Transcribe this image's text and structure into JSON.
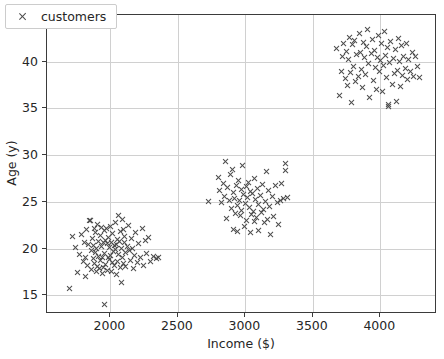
{
  "chart_data": {
    "type": "scatter",
    "title": "",
    "xlabel": "Income ($)",
    "ylabel": "Age (y)",
    "xlim": [
      1530,
      4420
    ],
    "ylim": [
      13.0,
      45.0
    ],
    "xticks": [
      2000,
      2500,
      3000,
      3500,
      4000
    ],
    "xticklabels": [
      "2000",
      "2500",
      "3000",
      "3500",
      "4000"
    ],
    "yticks": [
      15,
      20,
      25,
      30,
      35,
      40,
      45
    ],
    "yticklabels": [
      "15",
      "20",
      "25",
      "30",
      "35",
      "40",
      "45"
    ],
    "grid": true,
    "legend": {
      "position": "upper left",
      "entries": [
        {
          "label": "customers",
          "marker": "x",
          "color": "#4b4b4b"
        }
      ]
    },
    "series": [
      {
        "name": "customers",
        "marker": "x",
        "color": "#4b4b4b",
        "clusters": [
          {
            "name": "low-income",
            "center_x": 2010,
            "center_y": 19.6,
            "n": 120
          },
          {
            "name": "mid-income",
            "center_x": 3010,
            "center_y": 25.1,
            "n": 120
          },
          {
            "name": "high-income",
            "center_x": 4000,
            "center_y": 40.0,
            "n": 120
          }
        ],
        "points": [
          [
            1700,
            15.7
          ],
          [
            1958,
            14.0
          ],
          [
            1718,
            21.3
          ],
          [
            1745,
            20.1
          ],
          [
            1760,
            17.4
          ],
          [
            1772,
            19.4
          ],
          [
            1788,
            21.5
          ],
          [
            1800,
            18.6
          ],
          [
            1808,
            20.7
          ],
          [
            1815,
            17.0
          ],
          [
            1820,
            19.0
          ],
          [
            1826,
            22.0
          ],
          [
            1833,
            18.2
          ],
          [
            1840,
            20.4
          ],
          [
            1846,
            23.0
          ],
          [
            1852,
            23.0
          ],
          [
            1858,
            19.8
          ],
          [
            1862,
            17.8
          ],
          [
            1868,
            21.1
          ],
          [
            1872,
            18.9
          ],
          [
            1876,
            20.3
          ],
          [
            1880,
            22.2
          ],
          [
            1884,
            18.4
          ],
          [
            1888,
            19.6
          ],
          [
            1892,
            21.7
          ],
          [
            1896,
            17.6
          ],
          [
            1900,
            20.0
          ],
          [
            1904,
            18.1
          ],
          [
            1908,
            22.6
          ],
          [
            1912,
            19.2
          ],
          [
            1916,
            20.8
          ],
          [
            1920,
            17.9
          ],
          [
            1924,
            21.4
          ],
          [
            1928,
            18.7
          ],
          [
            1932,
            20.2
          ],
          [
            1936,
            22.3
          ],
          [
            1940,
            19.1
          ],
          [
            1944,
            17.3
          ],
          [
            1948,
            20.6
          ],
          [
            1952,
            18.0
          ],
          [
            1956,
            21.9
          ],
          [
            1960,
            19.5
          ],
          [
            1964,
            20.9
          ],
          [
            1968,
            18.3
          ],
          [
            1972,
            22.1
          ],
          [
            1976,
            17.7
          ],
          [
            1980,
            20.5
          ],
          [
            1984,
            19.0
          ],
          [
            1988,
            21.2
          ],
          [
            1992,
            18.8
          ],
          [
            1996,
            20.1
          ],
          [
            2000,
            22.4
          ],
          [
            2004,
            19.3
          ],
          [
            2008,
            17.5
          ],
          [
            2012,
            20.7
          ],
          [
            2016,
            18.5
          ],
          [
            2020,
            21.6
          ],
          [
            2024,
            19.7
          ],
          [
            2028,
            20.3
          ],
          [
            2032,
            18.2
          ],
          [
            2036,
            22.8
          ],
          [
            2040,
            19.9
          ],
          [
            2044,
            17.2
          ],
          [
            2048,
            20.4
          ],
          [
            2052,
            21.0
          ],
          [
            2056,
            18.6
          ],
          [
            2060,
            23.5
          ],
          [
            2064,
            19.4
          ],
          [
            2068,
            20.8
          ],
          [
            2072,
            18.0
          ],
          [
            2076,
            21.8
          ],
          [
            2080,
            16.4
          ],
          [
            2084,
            20.0
          ],
          [
            2088,
            23.1
          ],
          [
            2092,
            19.1
          ],
          [
            2096,
            22.0
          ],
          [
            2100,
            18.4
          ],
          [
            2104,
            20.6
          ],
          [
            2108,
            21.3
          ],
          [
            2112,
            19.6
          ],
          [
            2116,
            18.1
          ],
          [
            2124,
            20.2
          ],
          [
            2132,
            22.5
          ],
          [
            2140,
            19.8
          ],
          [
            2148,
            18.7
          ],
          [
            2156,
            21.1
          ],
          [
            2164,
            20.0
          ],
          [
            2172,
            17.9
          ],
          [
            2180,
            19.3
          ],
          [
            2190,
            21.7
          ],
          [
            2200,
            18.5
          ],
          [
            2212,
            20.5
          ],
          [
            2224,
            19.0
          ],
          [
            2236,
            22.1
          ],
          [
            2248,
            18.2
          ],
          [
            2260,
            20.9
          ],
          [
            2272,
            19.5
          ],
          [
            2286,
            21.2
          ],
          [
            2300,
            18.6
          ],
          [
            2320,
            19.2
          ],
          [
            2340,
            18.9
          ],
          [
            2360,
            19.0
          ],
          [
            2730,
            25.0
          ],
          [
            2800,
            27.6
          ],
          [
            2812,
            26.2
          ],
          [
            2824,
            24.9
          ],
          [
            2836,
            27.0
          ],
          [
            2848,
            25.6
          ],
          [
            2856,
            29.3
          ],
          [
            2864,
            23.2
          ],
          [
            2872,
            26.5
          ],
          [
            2880,
            25.1
          ],
          [
            2888,
            27.9
          ],
          [
            2896,
            24.3
          ],
          [
            2904,
            28.5
          ],
          [
            2910,
            26.0
          ],
          [
            2916,
            22.0
          ],
          [
            2922,
            25.4
          ],
          [
            2928,
            23.8
          ],
          [
            2934,
            26.8
          ],
          [
            2940,
            24.6
          ],
          [
            2946,
            21.8
          ],
          [
            2952,
            27.3
          ],
          [
            2958,
            25.2
          ],
          [
            2964,
            23.5
          ],
          [
            2970,
            26.3
          ],
          [
            2976,
            24.1
          ],
          [
            2982,
            28.9
          ],
          [
            2988,
            25.8
          ],
          [
            2994,
            22.4
          ],
          [
            3000,
            24.8
          ],
          [
            3006,
            26.6
          ],
          [
            3012,
            23.0
          ],
          [
            3018,
            25.5
          ],
          [
            3024,
            27.1
          ],
          [
            3030,
            24.4
          ],
          [
            3036,
            21.7
          ],
          [
            3042,
            26.1
          ],
          [
            3048,
            23.6
          ],
          [
            3054,
            25.9
          ],
          [
            3060,
            24.0
          ],
          [
            3066,
            27.5
          ],
          [
            3072,
            22.9
          ],
          [
            3078,
            25.3
          ],
          [
            3084,
            23.3
          ],
          [
            3090,
            26.4
          ],
          [
            3096,
            24.7
          ],
          [
            3102,
            21.9
          ],
          [
            3110,
            25.7
          ],
          [
            3118,
            23.9
          ],
          [
            3126,
            26.9
          ],
          [
            3134,
            24.2
          ],
          [
            3142,
            22.8
          ],
          [
            3150,
            25.0
          ],
          [
            3158,
            28.3
          ],
          [
            3166,
            23.1
          ],
          [
            3174,
            26.2
          ],
          [
            3182,
            24.5
          ],
          [
            3190,
            21.5
          ],
          [
            3200,
            25.6
          ],
          [
            3212,
            23.4
          ],
          [
            3224,
            26.7
          ],
          [
            3236,
            24.9
          ],
          [
            3248,
            22.6
          ],
          [
            3260,
            25.1
          ],
          [
            3272,
            27.0
          ],
          [
            3284,
            25.4
          ],
          [
            3296,
            29.1
          ],
          [
            3300,
            28.4
          ],
          [
            3312,
            25.5
          ],
          [
            3680,
            41.4
          ],
          [
            3700,
            36.4
          ],
          [
            3710,
            39.0
          ],
          [
            3720,
            40.6
          ],
          [
            3730,
            42.0
          ],
          [
            3740,
            38.2
          ],
          [
            3748,
            41.1
          ],
          [
            3756,
            37.5
          ],
          [
            3764,
            40.2
          ],
          [
            3772,
            42.6
          ],
          [
            3780,
            38.8
          ],
          [
            3788,
            35.6
          ],
          [
            3796,
            41.8
          ],
          [
            3804,
            39.5
          ],
          [
            3812,
            42.3
          ],
          [
            3820,
            37.9
          ],
          [
            3828,
            40.8
          ],
          [
            3836,
            38.4
          ],
          [
            3844,
            43.0
          ],
          [
            3852,
            41.0
          ],
          [
            3860,
            39.2
          ],
          [
            3868,
            37.2
          ],
          [
            3876,
            42.1
          ],
          [
            3884,
            40.4
          ],
          [
            3892,
            38.6
          ],
          [
            3900,
            41.6
          ],
          [
            3908,
            43.5
          ],
          [
            3916,
            39.8
          ],
          [
            3924,
            36.2
          ],
          [
            3932,
            40.9
          ],
          [
            3940,
            42.4
          ],
          [
            3948,
            38.0
          ],
          [
            3956,
            41.2
          ],
          [
            3964,
            39.4
          ],
          [
            3972,
            37.0
          ],
          [
            3980,
            40.5
          ],
          [
            3988,
            42.8
          ],
          [
            3996,
            38.9
          ],
          [
            4004,
            40.1
          ],
          [
            4012,
            41.9
          ],
          [
            4020,
            36.8
          ],
          [
            4028,
            39.6
          ],
          [
            4032,
            43.2
          ],
          [
            4040,
            40.7
          ],
          [
            4048,
            38.3
          ],
          [
            4056,
            41.5
          ],
          [
            4060,
            35.2
          ],
          [
            4064,
            35.4
          ],
          [
            4072,
            39.9
          ],
          [
            4080,
            42.2
          ],
          [
            4088,
            37.6
          ],
          [
            4096,
            40.3
          ],
          [
            4104,
            38.7
          ],
          [
            4112,
            41.3
          ],
          [
            4120,
            35.7
          ],
          [
            4128,
            39.1
          ],
          [
            4136,
            42.5
          ],
          [
            4144,
            40.0
          ],
          [
            4152,
            37.3
          ],
          [
            4160,
            41.7
          ],
          [
            4168,
            38.5
          ],
          [
            4176,
            40.6
          ],
          [
            4184,
            39.3
          ],
          [
            4192,
            41.9
          ],
          [
            4200,
            38.1
          ],
          [
            4212,
            40.2
          ],
          [
            4224,
            39.0
          ],
          [
            4236,
            41.0
          ],
          [
            4248,
            38.4
          ],
          [
            4260,
            40.6
          ],
          [
            4276,
            39.5
          ],
          [
            4290,
            38.3
          ]
        ]
      }
    ]
  }
}
